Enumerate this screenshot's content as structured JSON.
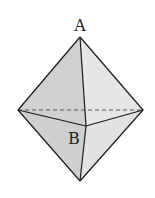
{
  "diagram": {
    "type": "octahedron",
    "labels": {
      "A": "A",
      "B": "B"
    },
    "vertices": {
      "top": [
        80,
        37
      ],
      "left": [
        18,
        110
      ],
      "right": [
        143,
        110
      ],
      "front": [
        86,
        126
      ],
      "bottom": [
        80,
        181
      ]
    },
    "colors": {
      "face_light": "#e4e4e4",
      "face_mid": "#d2d2d2",
      "face_dark": "#c4c4c4",
      "edge": "#1a1a1a",
      "hidden_edge": "#555555"
    }
  }
}
